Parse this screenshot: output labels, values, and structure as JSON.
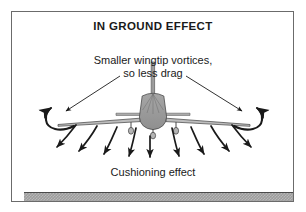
{
  "figure": {
    "title": "IN GROUND EFFECT",
    "annotations": {
      "vortex_label_line1": "Smaller wingtip vortices,",
      "vortex_label_line2": "so less drag",
      "cushion_label": "Cushioning effect"
    },
    "colors": {
      "frame_border": "#6b6b6b",
      "ground_fill": "#9d9d9d",
      "ground_pattern": "#b9b9b9",
      "ground_line": "#4a4a4a",
      "ink": "#1a1a1a",
      "aircraft_fill": "#9a9a9a",
      "aircraft_outline": "#4a4a4a",
      "background": "#ffffff"
    },
    "icons": [
      "aircraft-front-view-icon",
      "wingtip-vortex-curl-arrow-left-icon",
      "wingtip-vortex-curl-arrow-right-icon",
      "downwash-arrow-icon",
      "pointer-arrow-left-icon",
      "pointer-arrow-right-icon",
      "ground-surface-icon"
    ],
    "downwash_arrow_count": 10,
    "vortex_curl_count": 2,
    "pointer_arrow_count": 2
  }
}
